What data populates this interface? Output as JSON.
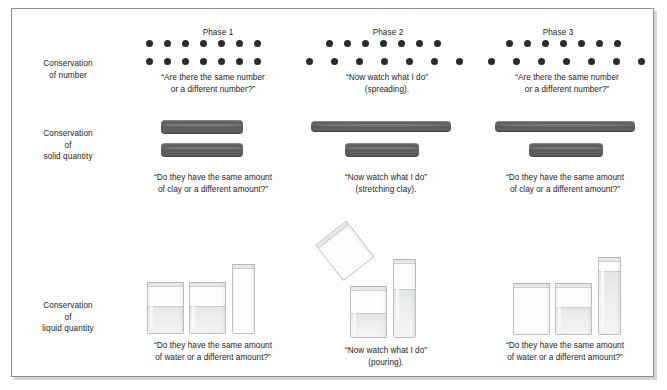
{
  "figure": {
    "frame_color": "#8d8d8d",
    "dot_color": "#2b2b2b",
    "clay_color": "#5e5e5e",
    "glass_color": "#bdbdbd",
    "water_color": "#e3e6e6"
  },
  "phases": [
    {
      "id": "phase-1",
      "label": "Phase 1"
    },
    {
      "id": "phase-2",
      "label": "Phase 2"
    },
    {
      "id": "phase-3",
      "label": "Phase 3"
    }
  ],
  "rows": [
    {
      "id": "conservation-of-number",
      "label": "Conservation\nof number",
      "captions": [
        "“Are there the same number\nor a different number?”",
        "“Now watch what I do”\n(spreading).",
        "“Are there the same number\nor a different number?”"
      ]
    },
    {
      "id": "conservation-of-solid-quantity",
      "label": "Conservation\nof\nsolid quantity",
      "captions": [
        "“Do they have the same amount\nof clay or a different amount?”",
        "“Now watch what I do”\n(stretching clay).",
        "“Do they have the same amount\nof clay or a different amount?”"
      ]
    },
    {
      "id": "conservation-of-liquid-quantity",
      "label": "Conservation\nof\nliquid quantity",
      "captions": [
        "“Do they have the same amount\nof water or a different amount?”",
        "“Now watch what I do”\n(pouring).",
        "“Do they have the same amount\nof water or a different amount?”"
      ]
    }
  ],
  "number_task": {
    "phase_1": {
      "top_row_count": 7,
      "bottom_row_count": 7,
      "top_spacing": "tight",
      "bottom_spacing": "tight"
    },
    "phase_2": {
      "top_row_count": 7,
      "bottom_row_count": 7,
      "top_spacing": "tight",
      "bottom_spacing": "spread"
    },
    "phase_3": {
      "top_row_count": 7,
      "bottom_row_count": 7,
      "top_spacing": "tight",
      "bottom_spacing": "spread"
    }
  },
  "solid_task": {
    "phase_1": {
      "top_bar": "short",
      "bottom_bar": "short"
    },
    "phase_2": {
      "top_bar": "stretched",
      "bottom_bar": "short"
    },
    "phase_3": {
      "top_bar": "stretched",
      "bottom_bar": "short"
    }
  },
  "liquid_task": {
    "phase_1": {
      "beakers": [
        "wide-half-full",
        "wide-half-full",
        "tall-empty"
      ]
    },
    "phase_2": {
      "beakers": [
        "wide-half-full",
        "tall-filling"
      ],
      "pouring_beaker": "tilted-wide"
    },
    "phase_3": {
      "beakers": [
        "wide-empty",
        "wide-half-full",
        "tall-full"
      ]
    }
  }
}
